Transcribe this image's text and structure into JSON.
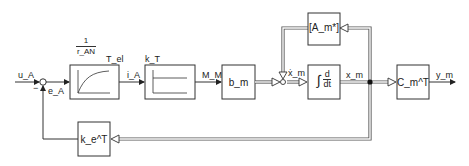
{
  "diagram": {
    "type": "state-space control block diagram",
    "signals": {
      "input": "u_A",
      "error": "e_A",
      "time_constant_out": "T_el",
      "current": "i_A",
      "motor_torque": "M_M",
      "state_derivative": "ẋ_m",
      "state": "x_m",
      "output": "y_m"
    },
    "blocks": {
      "pt1": {
        "gain_num": "1",
        "gain_den": "r_AN",
        "label": "T_el",
        "kind": "first-order lag"
      },
      "kt": {
        "label": "k_T",
        "kind": "proportional"
      },
      "bm": {
        "label": "b_m"
      },
      "integrator": {
        "symbol": "∫",
        "num": "d",
        "den": "dt"
      },
      "am": {
        "label": "[A_m*]"
      },
      "cm": {
        "label": "C_m^T"
      },
      "ke": {
        "label": "k_e^T"
      }
    },
    "summing_junction_sign": "−",
    "colors": {
      "line": "#333333",
      "vector_line": "#666666"
    }
  }
}
